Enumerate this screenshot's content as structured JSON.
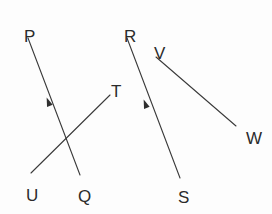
{
  "canvas": {
    "width": 272,
    "height": 214,
    "background_color": "#fdfdfd",
    "line_color": "#3a3a3a",
    "label_color": "#2b2b2b",
    "arrow_color": "#2f2f2f"
  },
  "chart_data": {
    "type": "diagram",
    "title": "",
    "points": [
      {
        "id": "P",
        "label": "P",
        "x": 24,
        "y": 28
      },
      {
        "id": "Q",
        "label": "Q",
        "x": 78,
        "y": 188
      },
      {
        "id": "R",
        "label": "R",
        "x": 124,
        "y": 28
      },
      {
        "id": "S",
        "label": "S",
        "x": 178,
        "y": 189
      },
      {
        "id": "T",
        "label": "T",
        "x": 111,
        "y": 83
      },
      {
        "id": "U",
        "label": "U",
        "x": 26,
        "y": 187
      },
      {
        "id": "V",
        "label": "V",
        "x": 154,
        "y": 45
      },
      {
        "id": "W",
        "label": "W",
        "x": 246,
        "y": 130
      }
    ],
    "segments": [
      {
        "id": "PQ",
        "from": "P",
        "to": "Q",
        "x1": 28,
        "y1": 38,
        "x2": 80,
        "y2": 175,
        "arrow": true,
        "arrow_direction": "toward-P",
        "arrow_x": 48,
        "arrow_y": 101
      },
      {
        "id": "UT",
        "from": "U",
        "to": "T",
        "x1": 31,
        "y1": 173,
        "x2": 110,
        "y2": 95,
        "arrow": false,
        "arrow_direction": "none",
        "arrow_x": null,
        "arrow_y": null
      },
      {
        "id": "RS",
        "from": "R",
        "to": "S",
        "x1": 127,
        "y1": 38,
        "x2": 180,
        "y2": 178,
        "arrow": true,
        "arrow_direction": "toward-R",
        "arrow_x": 145,
        "arrow_y": 103
      },
      {
        "id": "VW",
        "from": "V",
        "to": "W",
        "x1": 156,
        "y1": 57,
        "x2": 236,
        "y2": 126,
        "arrow": false,
        "arrow_direction": "none",
        "arrow_x": null,
        "arrow_y": null
      }
    ],
    "labels": [
      "P",
      "Q",
      "R",
      "S",
      "T",
      "U",
      "V",
      "W"
    ],
    "xlabel": "",
    "ylabel": "",
    "legend": [],
    "grid": false
  }
}
